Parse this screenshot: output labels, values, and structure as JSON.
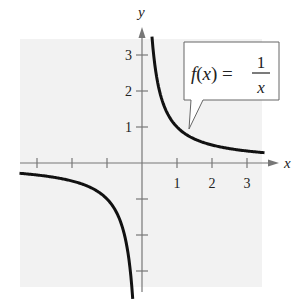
{
  "chart_data": {
    "type": "line",
    "title": "",
    "function_label": {
      "lhs": "f(x) =",
      "numerator": "1",
      "denominator": "x"
    },
    "xlabel": "x",
    "ylabel": "y",
    "x_ticks": [
      -3,
      -2,
      -1,
      1,
      2,
      3
    ],
    "x_tick_labels": [
      "1",
      "2",
      "3"
    ],
    "y_ticks": [
      -3,
      -2,
      -1,
      1,
      2,
      3
    ],
    "y_tick_labels": [
      "1",
      "2",
      "3"
    ],
    "xlim": [
      -3.5,
      3.5
    ],
    "ylim": [
      -3.5,
      3.5
    ],
    "grid": false,
    "series": [
      {
        "name": "f(x) = 1/x",
        "x": [
          -3.5,
          -3,
          -2,
          -1,
          -0.5,
          -0.3,
          -0.286
        ],
        "y": [
          -0.286,
          -0.333,
          -0.5,
          -1,
          -2,
          -3.33,
          -3.5
        ]
      },
      {
        "name": "f(x) = 1/x",
        "x": [
          0.286,
          0.3,
          0.5,
          1,
          2,
          3,
          3.5
        ],
        "y": [
          3.5,
          3.33,
          2,
          1,
          0.5,
          0.333,
          0.286
        ]
      }
    ]
  },
  "colors": {
    "background": "#f2f2f2",
    "curve": "#111111",
    "axis": "#777777"
  }
}
